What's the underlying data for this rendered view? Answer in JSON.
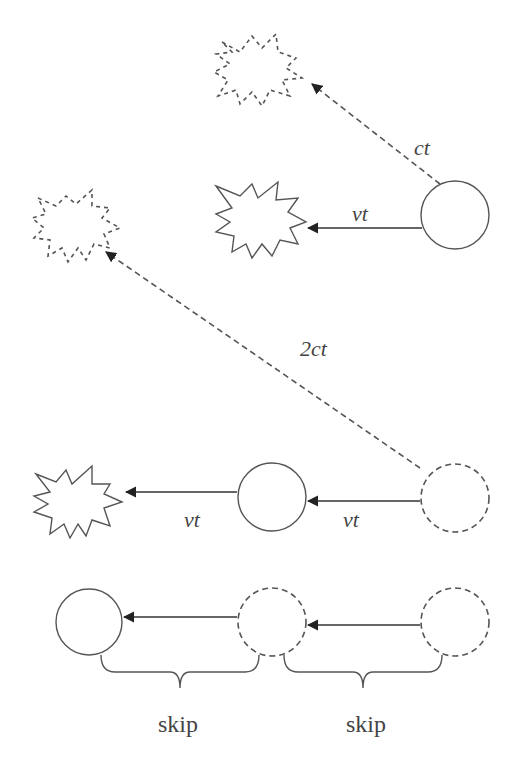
{
  "diagram": {
    "labels": {
      "ct": "ct",
      "vt_top": "vt",
      "two_ct": "2ct",
      "vt_row3_left": "vt",
      "vt_row3_right": "vt",
      "skip_left": "skip",
      "skip_right": "skip"
    },
    "colors": {
      "stroke": "#555555",
      "arrow": "#333333",
      "background": "#ffffff"
    }
  }
}
